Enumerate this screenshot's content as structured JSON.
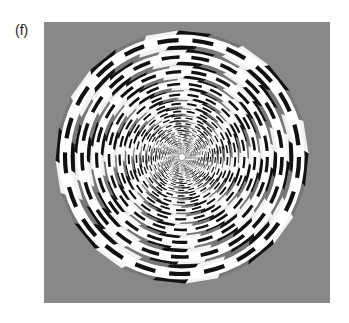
{
  "figure": {
    "label": "(f)",
    "colors": {
      "dark": "#111111",
      "mid": "#777777",
      "light": "#f2f2f2",
      "stroke": "#ffffff"
    }
  }
}
